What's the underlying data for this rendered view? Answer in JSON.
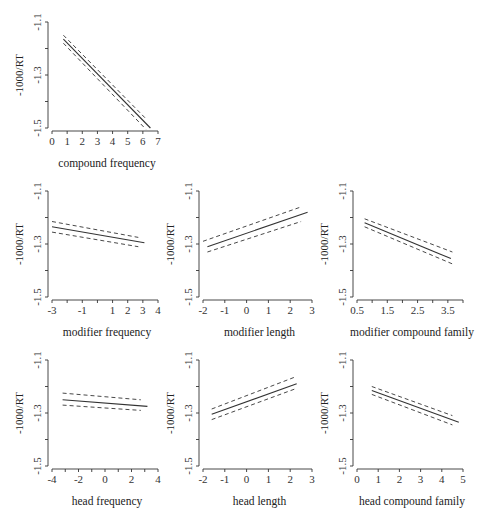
{
  "chart_data": [
    {
      "id": "compound-frequency",
      "type": "line",
      "title": "",
      "xlabel": "compound frequency",
      "ylabel": "-1000/RT",
      "xlim": [
        0,
        7
      ],
      "ylim": [
        -1.5,
        -1.1
      ],
      "xticks": [
        0,
        1,
        2,
        3,
        4,
        5,
        6,
        7
      ],
      "xtick_labels": [
        "0",
        "1",
        "2",
        "3",
        "4",
        "5",
        "6",
        "7"
      ],
      "yticks": [
        -1.1,
        -1.2,
        -1.3,
        -1.4,
        -1.5
      ],
      "ytick_labels": [
        "-1.1",
        "",
        "-1.3",
        "",
        "-1.5"
      ],
      "grid": false,
      "series": [
        {
          "name": "fit",
          "style": "solid",
          "x": [
            0.75,
            6.5
          ],
          "y": [
            -1.165,
            -1.5
          ]
        },
        {
          "name": "upper CI",
          "style": "dashed",
          "x": [
            0.75,
            6.2
          ],
          "y": [
            -1.15,
            -1.465
          ]
        },
        {
          "name": "lower CI",
          "style": "dashed",
          "x": [
            0.75,
            6.2
          ],
          "y": [
            -1.18,
            -1.505
          ]
        }
      ],
      "frame": {
        "x0": 52,
        "x1": 158,
        "y0": 128,
        "y1": 22,
        "axisX": 48,
        "axisY": 131
      }
    },
    {
      "id": "modifier-frequency",
      "type": "line",
      "xlabel": "modifier frequency",
      "ylabel": "-1000/RT",
      "xlim": [
        -3,
        4
      ],
      "ylim": [
        -1.5,
        -1.1
      ],
      "xticks": [
        -3,
        -2,
        -1,
        0,
        1,
        2,
        3,
        4
      ],
      "xtick_labels": [
        "-3",
        "",
        "-1",
        "",
        "1",
        "2",
        "3",
        "4"
      ],
      "yticks": [
        -1.1,
        -1.2,
        -1.3,
        -1.4,
        -1.5
      ],
      "ytick_labels": [
        "-1.1",
        "",
        "-1.3",
        "",
        "-1.5"
      ],
      "grid": false,
      "series": [
        {
          "name": "fit",
          "style": "solid",
          "x": [
            -3.0,
            3.1
          ],
          "y": [
            -1.235,
            -1.295
          ]
        },
        {
          "name": "upper CI",
          "style": "dashed",
          "x": [
            -3.0,
            2.7
          ],
          "y": [
            -1.215,
            -1.275
          ]
        },
        {
          "name": "lower CI",
          "style": "dashed",
          "x": [
            -3.0,
            2.7
          ],
          "y": [
            -1.255,
            -1.31
          ]
        }
      ],
      "frame": {
        "x0": 52,
        "x1": 158,
        "y0": 297,
        "y1": 191,
        "axisX": 48,
        "axisY": 300
      }
    },
    {
      "id": "modifier-length",
      "type": "line",
      "xlabel": "modifier length",
      "ylabel": "-1000/RT",
      "xlim": [
        -2,
        3
      ],
      "ylim": [
        -1.5,
        -1.1
      ],
      "xticks": [
        -2,
        -1,
        0,
        1,
        2,
        3
      ],
      "xtick_labels": [
        "-2",
        "-1",
        "0",
        "1",
        "2",
        "3"
      ],
      "yticks": [
        -1.1,
        -1.2,
        -1.3,
        -1.4,
        -1.5
      ],
      "ytick_labels": [
        "-1.1",
        "",
        "-1.3",
        "",
        "-1.5"
      ],
      "grid": false,
      "series": [
        {
          "name": "fit",
          "style": "solid",
          "x": [
            -1.8,
            2.8
          ],
          "y": [
            -1.31,
            -1.18
          ]
        },
        {
          "name": "upper CI",
          "style": "dashed",
          "x": [
            -2.0,
            2.5
          ],
          "y": [
            -1.29,
            -1.16
          ]
        },
        {
          "name": "lower CI",
          "style": "dashed",
          "x": [
            -1.8,
            2.5
          ],
          "y": [
            -1.33,
            -1.215
          ]
        }
      ],
      "frame": {
        "x0": 203,
        "x1": 312,
        "y0": 297,
        "y1": 191,
        "axisX": 199,
        "axisY": 300
      }
    },
    {
      "id": "modifier-compound-family",
      "type": "line",
      "xlabel": "modifier compound family",
      "ylabel": "-1000/RT",
      "xlim": [
        0.5,
        4.0
      ],
      "ylim": [
        -1.5,
        -1.1
      ],
      "xticks": [
        0.5,
        1.0,
        1.5,
        2.0,
        2.5,
        3.0,
        3.5,
        4.0
      ],
      "xtick_labels": [
        "0.5",
        "",
        "1.5",
        "",
        "2.5",
        "",
        "3.5",
        ""
      ],
      "yticks": [
        -1.1,
        -1.2,
        -1.3,
        -1.4,
        -1.5
      ],
      "ytick_labels": [
        "-1.1",
        "",
        "-1.3",
        "",
        "-1.5"
      ],
      "grid": false,
      "series": [
        {
          "name": "fit",
          "style": "solid",
          "x": [
            0.75,
            3.6
          ],
          "y": [
            -1.22,
            -1.355
          ]
        },
        {
          "name": "upper CI",
          "style": "dashed",
          "x": [
            0.75,
            3.65
          ],
          "y": [
            -1.205,
            -1.33
          ]
        },
        {
          "name": "lower CI",
          "style": "dashed",
          "x": [
            0.75,
            3.65
          ],
          "y": [
            -1.235,
            -1.375
          ]
        }
      ],
      "frame": {
        "x0": 357,
        "x1": 463,
        "y0": 297,
        "y1": 191,
        "axisX": 353,
        "axisY": 300
      }
    },
    {
      "id": "head-frequency",
      "type": "line",
      "xlabel": "head frequency",
      "ylabel": "-1000/RT",
      "xlim": [
        -4,
        4
      ],
      "ylim": [
        -1.5,
        -1.1
      ],
      "xticks": [
        -4,
        -3,
        -2,
        -1,
        0,
        1,
        2,
        3,
        4
      ],
      "xtick_labels": [
        "-4",
        "",
        "-2",
        "",
        "0",
        "",
        "2",
        "",
        "4"
      ],
      "yticks": [
        -1.1,
        -1.2,
        -1.3,
        -1.4,
        -1.5
      ],
      "ytick_labels": [
        "-1.1",
        "",
        "-1.3",
        "",
        "-1.5"
      ],
      "grid": false,
      "series": [
        {
          "name": "fit",
          "style": "solid",
          "x": [
            -3.2,
            3.2
          ],
          "y": [
            -1.25,
            -1.275
          ]
        },
        {
          "name": "upper CI",
          "style": "dashed",
          "x": [
            -3.2,
            2.7
          ],
          "y": [
            -1.225,
            -1.25
          ]
        },
        {
          "name": "lower CI",
          "style": "dashed",
          "x": [
            -3.2,
            2.7
          ],
          "y": [
            -1.27,
            -1.29
          ]
        }
      ],
      "frame": {
        "x0": 52,
        "x1": 158,
        "y0": 466,
        "y1": 360,
        "axisX": 48,
        "axisY": 469
      }
    },
    {
      "id": "head-length",
      "type": "line",
      "xlabel": "head length",
      "ylabel": "-1000/RT",
      "xlim": [
        -2,
        3
      ],
      "ylim": [
        -1.5,
        -1.1
      ],
      "xticks": [
        -2,
        -1,
        0,
        1,
        2,
        3
      ],
      "xtick_labels": [
        "-2",
        "-1",
        "0",
        "1",
        "2",
        "3"
      ],
      "yticks": [
        -1.1,
        -1.2,
        -1.3,
        -1.4,
        -1.5
      ],
      "ytick_labels": [
        "-1.1",
        "",
        "-1.3",
        "",
        "-1.5"
      ],
      "grid": false,
      "series": [
        {
          "name": "fit",
          "style": "solid",
          "x": [
            -1.6,
            2.3
          ],
          "y": [
            -1.305,
            -1.19
          ]
        },
        {
          "name": "upper CI",
          "style": "dashed",
          "x": [
            -1.6,
            2.2
          ],
          "y": [
            -1.285,
            -1.165
          ]
        },
        {
          "name": "lower CI",
          "style": "dashed",
          "x": [
            -1.6,
            2.2
          ],
          "y": [
            -1.325,
            -1.21
          ]
        }
      ],
      "frame": {
        "x0": 203,
        "x1": 312,
        "y0": 466,
        "y1": 360,
        "axisX": 199,
        "axisY": 469
      }
    },
    {
      "id": "head-compound-family",
      "type": "line",
      "xlabel": "head compound family",
      "ylabel": "-1000/RT",
      "xlim": [
        0,
        5
      ],
      "ylim": [
        -1.5,
        -1.1
      ],
      "xticks": [
        0,
        1,
        2,
        3,
        4,
        5
      ],
      "xtick_labels": [
        "0",
        "1",
        "2",
        "3",
        "4",
        "5"
      ],
      "yticks": [
        -1.1,
        -1.2,
        -1.3,
        -1.4,
        -1.5
      ],
      "ytick_labels": [
        "-1.1",
        "",
        "-1.3",
        "",
        "-1.5"
      ],
      "grid": false,
      "series": [
        {
          "name": "fit",
          "style": "solid",
          "x": [
            0.7,
            4.8
          ],
          "y": [
            -1.215,
            -1.335
          ]
        },
        {
          "name": "upper CI",
          "style": "dashed",
          "x": [
            0.7,
            4.5
          ],
          "y": [
            -1.2,
            -1.31
          ]
        },
        {
          "name": "lower CI",
          "style": "dashed",
          "x": [
            0.7,
            4.5
          ],
          "y": [
            -1.23,
            -1.345
          ]
        }
      ],
      "frame": {
        "x0": 357,
        "x1": 463,
        "y0": 466,
        "y1": 360,
        "axisX": 353,
        "axisY": 469
      }
    }
  ]
}
